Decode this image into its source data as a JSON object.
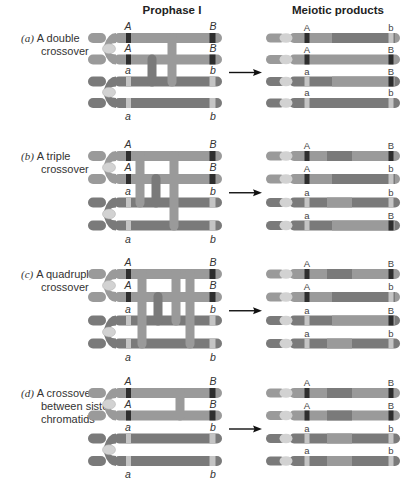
{
  "headers": {
    "prophase": "Prophase I",
    "products": "Meiotic products"
  },
  "colors": {
    "dark_chromatid": "#7a7a7a",
    "light_chromatid": "#9a9a9a",
    "centromere": "#d2d2d2",
    "dominant_band": "#2e2e2e",
    "recessive_band": "#c4c4c4",
    "arrow": "#111111"
  },
  "panels": [
    {
      "letter": "(a)",
      "label_lines": [
        "A double",
        "crossover"
      ],
      "prophase_alleles": {
        "top": [
          "A",
          "B"
        ],
        "rows": [
          [
            "A",
            "B"
          ],
          [
            "A",
            "B"
          ],
          [
            "a",
            "b"
          ],
          [
            "a",
            "b"
          ]
        ]
      },
      "products": [
        {
          "left": "A",
          "right": "b"
        },
        {
          "left": "A",
          "right": "B"
        },
        {
          "left": "a",
          "right": "B"
        },
        {
          "left": "a",
          "right": "b"
        }
      ]
    },
    {
      "letter": "(b)",
      "label_lines": [
        "A triple",
        "crossover"
      ],
      "prophase_alleles": {
        "rows": [
          [
            "A",
            "B"
          ],
          [
            "A",
            "B"
          ],
          [
            "a",
            "b"
          ],
          [
            "a",
            "b"
          ]
        ]
      },
      "products": [
        {
          "left": "A",
          "right": "B"
        },
        {
          "left": "A",
          "right": "b"
        },
        {
          "left": "a",
          "right": "b"
        },
        {
          "left": "a",
          "right": "B"
        }
      ]
    },
    {
      "letter": "(c)",
      "label_lines": [
        "A quadruple",
        "crossover"
      ],
      "prophase_alleles": {
        "rows": [
          [
            "A",
            "B"
          ],
          [
            "A",
            "B"
          ],
          [
            "a",
            "b"
          ],
          [
            "a",
            "b"
          ]
        ]
      },
      "products": [
        {
          "left": "A",
          "right": "B"
        },
        {
          "left": "A",
          "right": "b"
        },
        {
          "left": "a",
          "right": "B"
        },
        {
          "left": "a",
          "right": "b"
        }
      ]
    },
    {
      "letter": "(d)",
      "label_lines": [
        "A crossover",
        "between sister",
        "chromatids"
      ],
      "prophase_alleles": {
        "rows": [
          [
            "A",
            "B"
          ],
          [
            "A",
            "B"
          ],
          [
            "a",
            "b"
          ],
          [
            "a",
            "b"
          ]
        ]
      },
      "products": [
        {
          "left": "A",
          "right": "B"
        },
        {
          "left": "A",
          "right": "B"
        },
        {
          "left": "a",
          "right": "b"
        },
        {
          "left": "a",
          "right": "b"
        }
      ]
    }
  ]
}
